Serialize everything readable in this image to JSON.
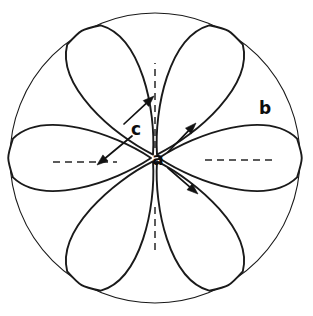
{
  "figure": {
    "kind": "rosette-diagram",
    "background_color": "#ffffff",
    "stroke_color": "#1a1a1a",
    "label_color": "#0d0d0d",
    "canvas": {
      "width": 313,
      "height": 316
    },
    "outer_circle": {
      "cx": 155,
      "cy": 158,
      "r": 145
    },
    "petal_count": 6,
    "labels": [
      {
        "id": "a",
        "text": "a",
        "x": 158,
        "y": 160
      },
      {
        "id": "b",
        "text": "b",
        "x": 265,
        "y": 109
      },
      {
        "id": "c",
        "text": "c",
        "x": 136,
        "y": 130
      }
    ],
    "dashed_lines": [
      {
        "id": "dash-up",
        "x1": 155,
        "y1": 148,
        "x2": 155,
        "y2": 63
      },
      {
        "id": "dash-right",
        "x1": 205,
        "y1": 160,
        "x2": 272,
        "y2": 160
      },
      {
        "id": "dash-left",
        "x1": 53,
        "y1": 162,
        "x2": 117,
        "y2": 162
      },
      {
        "id": "dash-down",
        "x1": 155,
        "y1": 207,
        "x2": 155,
        "y2": 252
      }
    ],
    "arrows": [
      {
        "id": "a-upper-right",
        "from_label": "a",
        "x1": 168,
        "y1": 152,
        "x2": 196,
        "y2": 123
      },
      {
        "id": "a-lower-right",
        "from_label": "a",
        "x1": 168,
        "y1": 168,
        "x2": 198,
        "y2": 194
      },
      {
        "id": "c-upper-right",
        "from_label": "c",
        "x1": 124,
        "y1": 124,
        "x2": 154,
        "y2": 96
      },
      {
        "id": "c-lower-left",
        "from_label": "c",
        "x1": 132,
        "y1": 136,
        "x2": 97,
        "y2": 165
      }
    ]
  }
}
